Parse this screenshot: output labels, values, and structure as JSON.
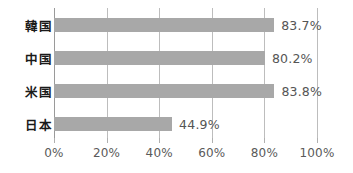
{
  "chart_data": {
    "type": "bar",
    "orientation": "horizontal",
    "title": "",
    "subtitle": "",
    "xlabel": "",
    "ylabel": "",
    "categories": [
      "韓国",
      "中国",
      "米国",
      "日本"
    ],
    "values": [
      83.7,
      80.2,
      83.8,
      44.9
    ],
    "value_labels": [
      "83.7%",
      "80.2%",
      "83.8%",
      "44.9%"
    ],
    "xlim": [
      0,
      100
    ],
    "xticks": [
      0,
      20,
      40,
      60,
      80,
      100
    ],
    "xtick_labels": [
      "0%",
      "20%",
      "40%",
      "60%",
      "80%",
      "100%"
    ],
    "grid": true,
    "legend": null,
    "colors": {
      "bar": "#a8a8a8",
      "gridline": "#bdbdbd",
      "axis": "#9a9a9a",
      "category_label": "#1a1a1a",
      "value_label": "#555555",
      "tick_label": "#5a5a5a",
      "background": "#ffffff"
    }
  }
}
